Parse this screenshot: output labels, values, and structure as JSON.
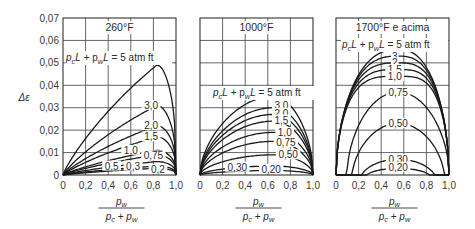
{
  "chart_data": [
    {
      "type": "line",
      "title": "260°F",
      "annotation": "pcL + pwL = 5 atm ft",
      "xlabel": "pw / (pc + pw)",
      "ylabel": "Δε",
      "xlim": [
        0,
        1.0
      ],
      "ylim": [
        0,
        0.07
      ],
      "grid": true,
      "x_ticks": [
        "0",
        "0,2",
        "0,4",
        "0,6",
        "0,8",
        "1,0"
      ],
      "y_ticks": [
        "0",
        "0,01",
        "0,02",
        "0,03",
        "0,04",
        "0,05",
        "0,06",
        "0,07"
      ],
      "peak_x": 0.83,
      "series": [
        {
          "name": "5",
          "peak": 0.049
        },
        {
          "name": "3,0",
          "peak": 0.031
        },
        {
          "name": "2,0",
          "peak": 0.022
        },
        {
          "name": "1,5",
          "peak": 0.017
        },
        {
          "name": "1,0",
          "peak": 0.011
        },
        {
          "name": "0,75",
          "peak": 0.009
        },
        {
          "name": "0,5",
          "peak": 0.006
        },
        {
          "name": "0,3",
          "peak": 0.004
        },
        {
          "name": "0,2",
          "peak": 0.003
        }
      ]
    },
    {
      "type": "line",
      "title": "1000°F",
      "annotation": "pcL + pwL = 5 atm ft",
      "xlabel": "pw / (pc + pw)",
      "xlim": [
        0,
        1.0
      ],
      "ylim": [
        0,
        0.07
      ],
      "grid": true,
      "x_ticks": [
        "0",
        "0,2",
        "0,4",
        "0,6",
        "0,8",
        "1,0"
      ],
      "peak_x": 0.65,
      "series": [
        {
          "name": "5",
          "peak": 0.035
        },
        {
          "name": "3,0",
          "peak": 0.03
        },
        {
          "name": "2,0",
          "peak": 0.027
        },
        {
          "name": "1,5",
          "peak": 0.024
        },
        {
          "name": "1,0",
          "peak": 0.019
        },
        {
          "name": "0,75",
          "peak": 0.015
        },
        {
          "name": "0,50",
          "peak": 0.009
        },
        {
          "name": "0,30",
          "peak": 0.004
        },
        {
          "name": "0,20",
          "peak": 0.002
        }
      ]
    },
    {
      "type": "line",
      "title": "1700°F e acima",
      "annotation": "pcL + pwL = 5 atm ft",
      "xlabel": "pw / (pc + pw)",
      "xlim": [
        0,
        1.0
      ],
      "ylim": [
        0,
        0.07
      ],
      "grid": true,
      "x_ticks": [
        "0",
        "0,2",
        "0,4",
        "0,6",
        "0,8",
        "1,0"
      ],
      "peak_x": 0.55,
      "series": [
        {
          "name": "5",
          "peak": 0.056
        },
        {
          "name": "3",
          "peak": 0.053
        },
        {
          "name": "2",
          "peak": 0.05
        },
        {
          "name": "1,5",
          "peak": 0.047
        },
        {
          "name": "1,0",
          "peak": 0.044
        },
        {
          "name": "0,75",
          "peak": 0.037
        },
        {
          "name": "0,50",
          "peak": 0.023
        },
        {
          "name": "0,30",
          "peak": 0.007
        },
        {
          "name": "0,20",
          "peak": 0.003
        }
      ]
    }
  ],
  "labels": {
    "y_axis": "Δε",
    "x_num": "p",
    "x_num_sub": "w",
    "x_den_a": "p",
    "x_den_a_sub": "c",
    "x_den_plus": " + ",
    "x_den_b": "p",
    "x_den_b_sub": "w",
    "ann_pre": "p",
    "ann_sub1": "c",
    "ann_mid": "L + p",
    "ann_sub2": "w",
    "ann_post": "L = 5 atm ft"
  }
}
